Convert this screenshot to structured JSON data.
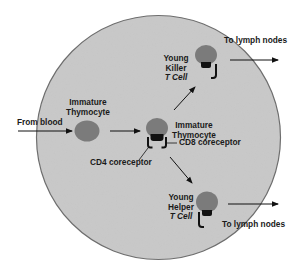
{
  "diagram": {
    "colors": {
      "background": "#ffffff",
      "thymus_fill": "#c9c9c9",
      "thymus_outline": "#6e6e6e",
      "cell_fill": "#7b7b7b",
      "receptor": "#111111",
      "arrow": "#111111",
      "text": "#1a1a1a"
    },
    "labels": {
      "from_blood": "From blood",
      "immature_thymocyte_left": {
        "line1": "Immature",
        "line2": "Thymocyte"
      },
      "immature_thymocyte_center": {
        "line1": "Immature",
        "line2": "Thymocyte"
      },
      "cd8_coreceptor": "CD8 coreceptor",
      "cd4_coreceptor": "CD4 coreceptor",
      "young_killer": {
        "line1": "Young",
        "line2": "Killer",
        "line3": "T Cell"
      },
      "young_helper": {
        "line1": "Young",
        "line2": "Helper",
        "line3": "T Cell"
      },
      "to_lymph_nodes_top": "To lymph nodes",
      "to_lymph_nodes_bottom": "To lymph nodes"
    },
    "nodes": [
      {
        "id": "immature-thymocyte-left",
        "type": "cell",
        "cx": 86,
        "cy": 131
      },
      {
        "id": "immature-thymocyte-center",
        "type": "cell-with-cd4-cd8",
        "cx": 157,
        "cy": 129
      },
      {
        "id": "young-killer-t-cell",
        "type": "cell-with-cd8",
        "cx": 206,
        "cy": 57
      },
      {
        "id": "young-helper-t-cell",
        "type": "cell-with-cd4",
        "cx": 207,
        "cy": 203
      }
    ],
    "edges": [
      {
        "from": "blood",
        "to": "immature-thymocyte-left"
      },
      {
        "from": "immature-thymocyte-left",
        "to": "immature-thymocyte-center"
      },
      {
        "from": "immature-thymocyte-center",
        "to": "young-killer-t-cell"
      },
      {
        "from": "immature-thymocyte-center",
        "to": "young-helper-t-cell"
      },
      {
        "from": "young-killer-t-cell",
        "to": "lymph-nodes"
      },
      {
        "from": "young-helper-t-cell",
        "to": "lymph-nodes"
      }
    ]
  }
}
